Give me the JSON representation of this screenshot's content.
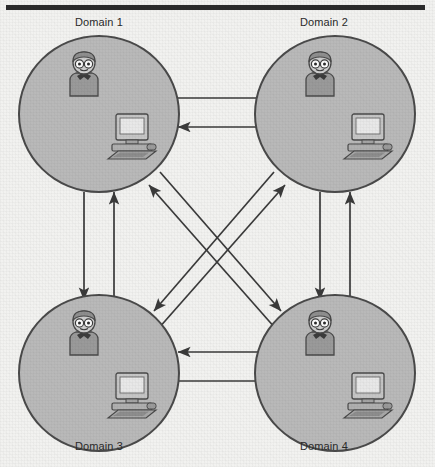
{
  "figure": {
    "background_color": "#f2f2f0",
    "rule_color": "#2b2b2b",
    "circle_fill": "#b9b9b9",
    "circle_stroke": "#4a4a4a",
    "arrow_color": "#3a3a3a"
  },
  "domains": [
    {
      "id": "d1",
      "label": "Domain 1",
      "label_position": "above",
      "user_icon": "user-person-icon",
      "computer_icon": "desktop-computer-icon"
    },
    {
      "id": "d2",
      "label": "Domain 2",
      "label_position": "above",
      "user_icon": "user-person-icon",
      "computer_icon": "desktop-computer-icon"
    },
    {
      "id": "d3",
      "label": "Domain 3",
      "label_position": "below",
      "user_icon": "user-person-icon",
      "computer_icon": "desktop-computer-icon"
    },
    {
      "id": "d4",
      "label": "Domain 4",
      "label_position": "below",
      "user_icon": "user-person-icon",
      "computer_icon": "desktop-computer-icon"
    }
  ],
  "trust_links": [
    {
      "from": "Domain 1",
      "to": "Domain 2",
      "direction": "right",
      "orientation": "horizontal-top"
    },
    {
      "from": "Domain 2",
      "to": "Domain 1",
      "direction": "left",
      "orientation": "horizontal-top"
    },
    {
      "from": "Domain 1",
      "to": "Domain 3",
      "direction": "down",
      "orientation": "vertical-left"
    },
    {
      "from": "Domain 3",
      "to": "Domain 1",
      "direction": "up",
      "orientation": "vertical-left"
    },
    {
      "from": "Domain 2",
      "to": "Domain 4",
      "direction": "down",
      "orientation": "vertical-right"
    },
    {
      "from": "Domain 4",
      "to": "Domain 2",
      "direction": "up",
      "orientation": "vertical-right"
    },
    {
      "from": "Domain 3",
      "to": "Domain 4",
      "direction": "right",
      "orientation": "horizontal-bottom"
    },
    {
      "from": "Domain 4",
      "to": "Domain 3",
      "direction": "left",
      "orientation": "horizontal-bottom"
    },
    {
      "from": "Domain 1",
      "to": "Domain 4",
      "direction": "down-right",
      "orientation": "diagonal"
    },
    {
      "from": "Domain 4",
      "to": "Domain 1",
      "direction": "up-left",
      "orientation": "diagonal"
    },
    {
      "from": "Domain 2",
      "to": "Domain 3",
      "direction": "down-left",
      "orientation": "diagonal"
    },
    {
      "from": "Domain 3",
      "to": "Domain 2",
      "direction": "up-right",
      "orientation": "diagonal"
    }
  ]
}
